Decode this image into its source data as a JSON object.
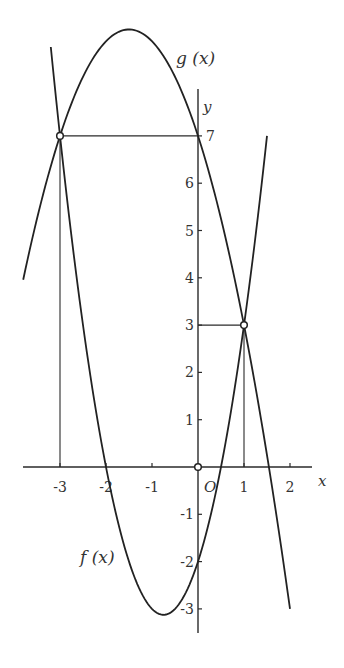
{
  "chart_data": {
    "type": "line",
    "title": "",
    "xlabel": "x",
    "ylabel": "y",
    "origin_label": "O",
    "xlim": [
      -3.8,
      2.5
    ],
    "ylim": [
      -3.5,
      8.2
    ],
    "grid": false,
    "x_ticks": [
      {
        "value": -3,
        "label": "-3"
      },
      {
        "value": -2,
        "label": "-2"
      },
      {
        "value": -1,
        "label": "-1"
      },
      {
        "value": 1,
        "label": "1"
      },
      {
        "value": 2,
        "label": "2"
      }
    ],
    "y_ticks": [
      {
        "value": 7,
        "label": "7"
      },
      {
        "value": 6,
        "label": "6"
      },
      {
        "value": 5,
        "label": "5"
      },
      {
        "value": 4,
        "label": "4"
      },
      {
        "value": 3,
        "label": "3"
      },
      {
        "value": 2,
        "label": "2"
      },
      {
        "value": 1,
        "label": "1"
      },
      {
        "value": -1,
        "label": "-1"
      },
      {
        "value": -2,
        "label": "-2"
      },
      {
        "value": -3,
        "label": "-3"
      }
    ],
    "series": [
      {
        "name": "f (x)",
        "label": "f (x)",
        "coefficients": [
          2,
          3,
          -2
        ],
        "domain": [
          -3.2,
          1.5
        ]
      },
      {
        "name": "g (x)",
        "label": "g (x)",
        "coefficients": [
          -1,
          -3,
          7
        ],
        "domain": [
          -3.8,
          2.0
        ]
      }
    ],
    "intersection_points": [
      {
        "x": -3,
        "y": 7
      },
      {
        "x": 1,
        "y": 3
      },
      {
        "x": 0,
        "y": 0
      }
    ],
    "guide_lines": [
      {
        "from": [
          -3,
          0
        ],
        "to": [
          -3,
          7
        ]
      },
      {
        "from": [
          -3,
          7
        ],
        "to": [
          0,
          7
        ]
      },
      {
        "from": [
          1,
          0
        ],
        "to": [
          1,
          3
        ]
      },
      {
        "from": [
          0,
          3
        ],
        "to": [
          1,
          3
        ]
      }
    ]
  }
}
